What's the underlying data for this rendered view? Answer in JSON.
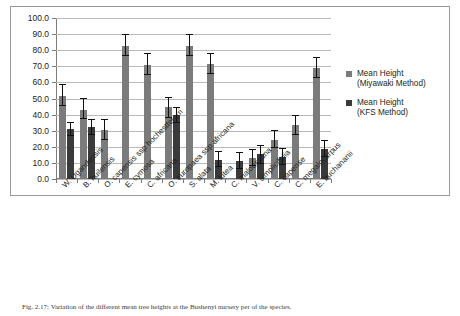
{
  "chart_data": {
    "type": "bar",
    "title": "",
    "xlabel": "",
    "ylabel": "",
    "ylim": [
      0,
      100
    ],
    "ytick_step": 10,
    "ytick_labels": [
      "0.0",
      "10.0",
      "20.0",
      "30.0",
      "40.0",
      "50.0",
      "60.0",
      "70.0",
      "80.0",
      "90.0",
      "100.0"
    ],
    "grid": "horizontal",
    "legend_position": "right",
    "orientation": "vertical",
    "categories": [
      "W. Ugandensis",
      "B. huilensis",
      "O. capensis ssp hochestteterri",
      "E. cymosa",
      "C. africana",
      "O. europaea ssp africana",
      "S. alata",
      "M. lutea",
      "C. maloussana",
      "V. simplicifolia",
      "C. capense",
      "C. megalocarpus",
      "E. buchananii"
    ],
    "series": [
      {
        "name": "Mean Height (Miyawaki Method)",
        "color": "#7b7b7b",
        "values": [
          51.5,
          43.0,
          30.5,
          82.5,
          71.0,
          44.5,
          82.5,
          71.5,
          null,
          13.0,
          24.5,
          33.5,
          69.0
        ],
        "err_low": [
          45.5,
          37.0,
          24.0,
          76.5,
          64.5,
          38.0,
          76.5,
          65.0,
          null,
          8.0,
          19.0,
          27.5,
          63.0
        ],
        "err_high": [
          59.0,
          50.5,
          37.5,
          90.0,
          78.0,
          51.0,
          90.0,
          78.0,
          null,
          18.5,
          30.5,
          40.0,
          75.5
        ]
      },
      {
        "name": "Mean Height (KFS Method)",
        "color": "#3a3a3a",
        "values": [
          31.0,
          32.5,
          null,
          null,
          null,
          40.0,
          null,
          12.0,
          11.5,
          15.5,
          13.5,
          null,
          18.5
        ],
        "err_low": [
          26.5,
          27.5,
          null,
          null,
          null,
          35.0,
          null,
          7.5,
          6.0,
          9.5,
          8.5,
          null,
          13.5
        ],
        "err_high": [
          35.5,
          37.0,
          null,
          null,
          null,
          45.0,
          null,
          17.5,
          17.0,
          21.0,
          19.5,
          null,
          24.0
        ]
      }
    ]
  },
  "legend": {
    "entries": [
      {
        "line1": "Mean Height",
        "line2": "(Miyawaki Method)",
        "swatch": "s0"
      },
      {
        "line1": "Mean Height",
        "line2": "(KFS Method)",
        "swatch": "s1"
      }
    ]
  },
  "caption": {
    "text": "Fig. 2.17: Variation of the different mean tree heights at the Bushenyi nursery per of the species."
  }
}
